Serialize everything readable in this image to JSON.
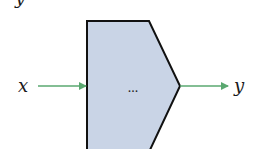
{
  "diagram": {
    "type": "block-diagram",
    "top_partial_label": "y",
    "input": {
      "label": "x"
    },
    "output": {
      "label": "y"
    },
    "block": {
      "shape": "pentagon-arrow",
      "content": "...",
      "fill_color": "#c9d4e6",
      "stroke_color": "#111111"
    },
    "arrow_color": "#5aa870"
  }
}
